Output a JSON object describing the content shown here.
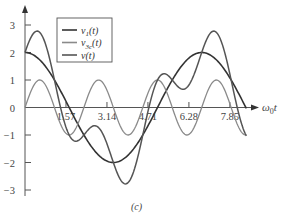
{
  "chart_data": {
    "type": "line",
    "title": "",
    "caption": "(c)",
    "xlabel": "ω0t",
    "ylabel": "",
    "xlim": [
      0,
      8.8
    ],
    "ylim": [
      -3,
      3
    ],
    "x_ticks": [
      "1.57",
      "3.14",
      "4.71",
      "6.28",
      "7.85"
    ],
    "x_tick_values": [
      1.57,
      3.14,
      4.71,
      6.28,
      7.85
    ],
    "y_ticks": [
      "3",
      "2",
      "1",
      "0",
      "−1",
      "−2",
      "−3"
    ],
    "y_tick_values": [
      3,
      2,
      1,
      0,
      -1,
      -2,
      -3
    ],
    "grid": false,
    "legend_position": "upper-left-inside",
    "x_end": 8.5,
    "series": [
      {
        "name": "v1(t)",
        "label_main": "v",
        "label_sub": "1",
        "label_tail": "(t)",
        "formula": "2cos(ω0t)",
        "amplitude": 2,
        "harmonic": 1,
        "kind": "cos",
        "color": "#333333",
        "width": 1.6,
        "x": [
          0,
          1.57,
          3.14,
          4.71,
          6.28,
          7.85
        ],
        "values": [
          2.0,
          0.1,
          -1.95,
          -0.2,
          1.9,
          0.3
        ]
      },
      {
        "name": "v3c(t)",
        "label_main": "v",
        "label_sub": "3c",
        "label_tail": "(t)",
        "formula": "sin(3ω0t)",
        "amplitude": 1,
        "harmonic": 3,
        "kind": "sin",
        "color": "#8a8a8a",
        "width": 1.3,
        "x": [
          0,
          0.5,
          1.57,
          2.6,
          3.7,
          5.0,
          6.1,
          7.3
        ],
        "values": [
          0,
          1,
          -1,
          1,
          -1,
          1,
          -1,
          1
        ]
      },
      {
        "name": "v(t)",
        "label_main": "v",
        "label_sub": "",
        "label_tail": "(t)",
        "formula": "v1(t)+v3c(t)",
        "amplitude": null,
        "harmonic": null,
        "kind": "sum",
        "color": "#555555",
        "width": 1.5,
        "x": [
          0,
          0.5,
          1.57,
          2.6,
          3.7,
          4.71,
          6.6,
          7.85
        ],
        "values": [
          2.0,
          2.85,
          -1.1,
          -0.6,
          -2.8,
          0.1,
          2.9,
          0.2
        ]
      }
    ],
    "period_fundamental": 6.77
  },
  "legend": {
    "items": [
      {
        "main": "v",
        "sub": "1",
        "tail": "(t)"
      },
      {
        "main": "v",
        "sub": "3c",
        "tail": "(t)"
      },
      {
        "main": "v",
        "sub": "",
        "tail": "(t)"
      }
    ]
  }
}
